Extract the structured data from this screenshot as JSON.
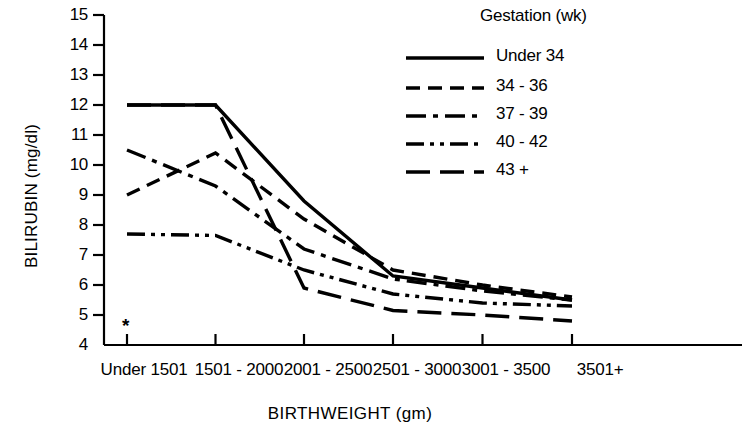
{
  "chart_data": {
    "type": "line",
    "title": "",
    "xlabel": "BIRTHWEIGHT (gm)",
    "ylabel": "BILIRUBIN (mg/dl)",
    "categories": [
      "Under 1501",
      "1501 - 2000",
      "2001 - 2500",
      "2501 - 3000",
      "3001 - 3500",
      "3501+"
    ],
    "ylim": [
      4,
      15
    ],
    "yticks": [
      4,
      5,
      6,
      7,
      8,
      9,
      10,
      11,
      12,
      13,
      14,
      15
    ],
    "grid": false,
    "legend_position": "top-right",
    "legend_title": "Gestation (wk)",
    "annotations": [
      {
        "text": "*",
        "x_category": "Under 1501",
        "y": 4.7
      }
    ],
    "series": [
      {
        "name": "Under 34",
        "line_style": "solid",
        "dasharray": "",
        "values": [
          12.0,
          12.0,
          8.8,
          6.3,
          5.9,
          5.5
        ]
      },
      {
        "name": "34 - 36",
        "line_style": "dashed",
        "dasharray": "14,8",
        "values": [
          9.0,
          10.4,
          8.2,
          6.5,
          6.0,
          5.6
        ]
      },
      {
        "name": "37 - 39",
        "line_style": "dash-dot",
        "dasharray": "20,7,5,7",
        "values": [
          10.5,
          9.3,
          7.2,
          6.2,
          5.8,
          5.5
        ]
      },
      {
        "name": "40 - 42",
        "line_style": "dash-dot-dot",
        "dasharray": "18,6,4,6,4,6",
        "values": [
          7.7,
          7.65,
          6.5,
          5.7,
          5.4,
          5.3
        ]
      },
      {
        "name": "43 +",
        "line_style": "long-dash",
        "dasharray": "24,10",
        "values": [
          12.0,
          12.0,
          5.9,
          5.15,
          5.0,
          4.8
        ]
      }
    ]
  },
  "axis": {
    "y_tick_labels": [
      "15",
      "14",
      "13",
      "12",
      "11",
      "10",
      "9",
      "8",
      "7",
      "6",
      "5",
      "4"
    ],
    "x_tick_labels": [
      "Under 1501",
      "1501 - 2000",
      "2001 - 2500",
      "2501 - 3000",
      "3001 - 3500",
      "3501+"
    ]
  },
  "style": {
    "line_color": "#000000",
    "axis_color": "#000000",
    "background": "#ffffff"
  }
}
